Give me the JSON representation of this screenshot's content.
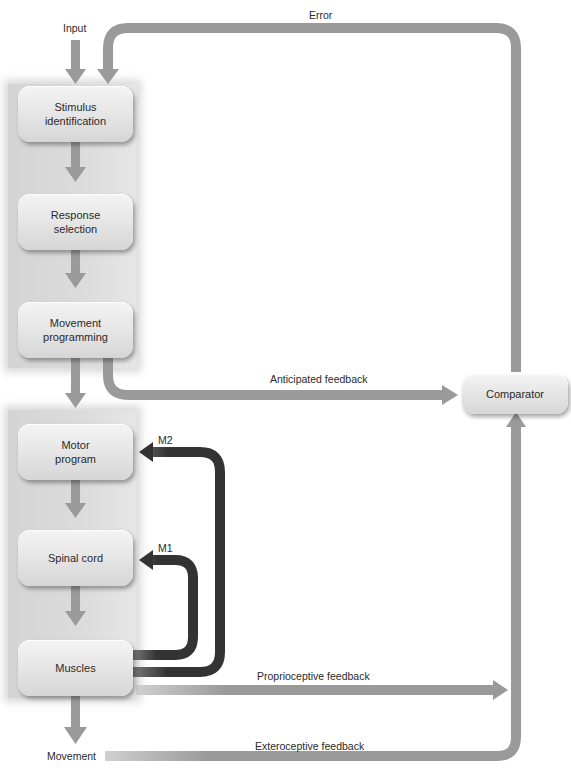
{
  "diagram": {
    "title": "",
    "boxes": {
      "stimulus_identification": "Stimulus\nidentification",
      "response_selection": "Response\nselection",
      "movement_programming": "Movement\nprogramming",
      "motor_program": "Motor\nprogram",
      "spinal_cord": "Spinal cord",
      "muscles": "Muscles",
      "comparator": "Comparator"
    },
    "labels": {
      "input": "Input",
      "error": "Error",
      "anticipated_feedback": "Anticipated feedback",
      "m2": "M2",
      "m1": "M1",
      "proprioceptive_feedback": "Proprioceptive feedback",
      "exteroceptive_feedback": "Exteroceptive feedback",
      "movement": "Movement"
    },
    "colors": {
      "flow_arrow": "#9a9a9a",
      "reflex_loop": "#333333",
      "panel": "#d8d8d8",
      "box": "#e6e6e6"
    }
  }
}
